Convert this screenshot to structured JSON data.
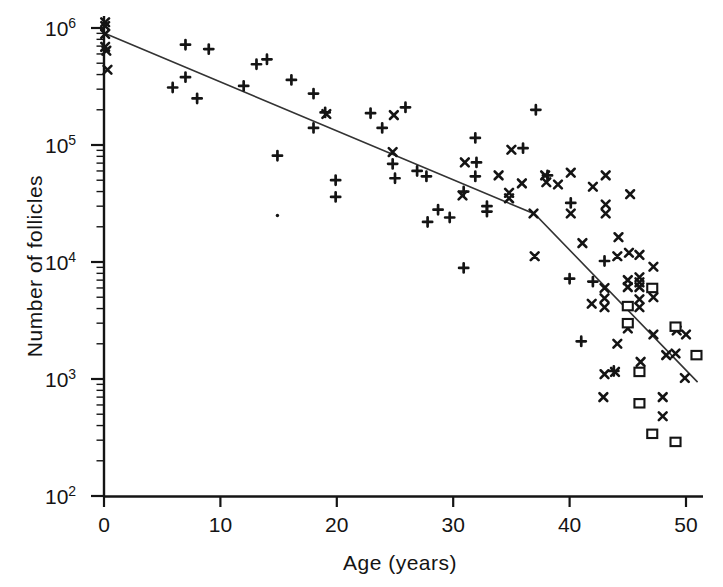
{
  "figure": {
    "width": 723,
    "height": 587,
    "background_color": "#ffffff",
    "ink_color": "#141414",
    "fit_line_color": "#333333"
  },
  "chart_data": {
    "type": "scatter",
    "title": "",
    "xlabel": "Age (years)",
    "ylabel": "Number of follicles",
    "x_ticks": [
      0,
      10,
      20,
      30,
      40,
      50
    ],
    "xlim": [
      0,
      51.5
    ],
    "y_scale": "log10",
    "y_tick_base": "10",
    "y_tick_exponents": [
      6,
      5,
      4,
      3,
      2
    ],
    "y_minor_tick_decades": [
      2,
      3,
      4,
      5
    ],
    "ylim": [
      100,
      1250000
    ],
    "grid": "off",
    "legend": "none",
    "fit_line": {
      "description": "biphasic decline fit with breakpoint near age 37",
      "points_age_count": [
        [
          0,
          905000
        ],
        [
          37,
          25700
        ],
        [
          51,
          940
        ]
      ]
    },
    "series": [
      {
        "name": "plus-markers",
        "marker": "plus",
        "points_age_count": [
          [
            7.0,
            720000
          ],
          [
            9.0,
            660000
          ],
          [
            5.9,
            310000
          ],
          [
            7.0,
            380000
          ],
          [
            8.0,
            250000
          ],
          [
            12.0,
            320000
          ],
          [
            13.1,
            490000
          ],
          [
            14.0,
            540000
          ],
          [
            16.1,
            360000
          ],
          [
            18.0,
            275000
          ],
          [
            18.0,
            140000
          ],
          [
            19.0,
            190000
          ],
          [
            14.9,
            81000
          ],
          [
            19.9,
            50000
          ],
          [
            19.9,
            36000
          ],
          [
            22.9,
            187000
          ],
          [
            25.9,
            210000
          ],
          [
            23.9,
            140000
          ],
          [
            24.8,
            69000
          ],
          [
            25.0,
            52000
          ],
          [
            26.9,
            60000
          ],
          [
            27.7,
            54000
          ],
          [
            31.9,
            115000
          ],
          [
            32.0,
            71000
          ],
          [
            31.9,
            54000
          ],
          [
            36.0,
            94000
          ],
          [
            37.1,
            200000
          ],
          [
            30.9,
            40000
          ],
          [
            28.7,
            28000
          ],
          [
            27.8,
            22000
          ],
          [
            29.7,
            24000
          ],
          [
            32.9,
            30000
          ],
          [
            32.9,
            27000
          ],
          [
            30.9,
            8900
          ],
          [
            38.1,
            55000
          ],
          [
            40.1,
            32000
          ],
          [
            43.0,
            10200
          ],
          [
            40.0,
            7200
          ],
          [
            42.0,
            6800
          ],
          [
            41.0,
            2100
          ],
          [
            43.8,
            1170
          ]
        ]
      },
      {
        "name": "cross-markers",
        "marker": "cross",
        "points_age_count": [
          [
            0.1,
            1120000
          ],
          [
            0.1,
            1040000
          ],
          [
            0.1,
            890000
          ],
          [
            0.1,
            690000
          ],
          [
            0.2,
            640000
          ],
          [
            0.3,
            440000
          ],
          [
            19.1,
            184000
          ],
          [
            24.9,
            180000
          ],
          [
            24.8,
            87000
          ],
          [
            31.0,
            71000
          ],
          [
            33.9,
            55000
          ],
          [
            35.0,
            91000
          ],
          [
            30.8,
            37000
          ],
          [
            34.8,
            39000
          ],
          [
            34.8,
            35000
          ],
          [
            35.9,
            47000
          ],
          [
            36.9,
            26000
          ],
          [
            37.9,
            55000
          ],
          [
            38.0,
            48000
          ],
          [
            39.0,
            46000
          ],
          [
            40.1,
            58000
          ],
          [
            42.0,
            44000
          ],
          [
            43.1,
            55000
          ],
          [
            45.2,
            38000
          ],
          [
            40.1,
            26000
          ],
          [
            43.1,
            31000
          ],
          [
            43.1,
            26000
          ],
          [
            41.1,
            14500
          ],
          [
            44.2,
            16300
          ],
          [
            37.0,
            11200
          ],
          [
            44.1,
            11200
          ],
          [
            45.1,
            12000
          ],
          [
            46.0,
            11500
          ],
          [
            47.2,
            9100
          ],
          [
            43.0,
            6000
          ],
          [
            45.0,
            7000
          ],
          [
            45.0,
            6100
          ],
          [
            46.0,
            7400
          ],
          [
            46.0,
            6700
          ],
          [
            46.0,
            6100
          ],
          [
            46.0,
            4800
          ],
          [
            47.2,
            5000
          ],
          [
            46.0,
            4100
          ],
          [
            43.0,
            4900
          ],
          [
            41.9,
            4400
          ],
          [
            43.0,
            4100
          ],
          [
            49.2,
            2600
          ],
          [
            50.0,
            2400
          ],
          [
            47.2,
            2400
          ],
          [
            45.0,
            2700
          ],
          [
            44.1,
            2000
          ],
          [
            48.3,
            1600
          ],
          [
            49.1,
            1650
          ],
          [
            46.1,
            1400
          ],
          [
            43.0,
            1100
          ],
          [
            43.9,
            1150
          ],
          [
            49.9,
            1020
          ],
          [
            42.9,
            700
          ],
          [
            48.0,
            700
          ],
          [
            48.0,
            480
          ]
        ]
      },
      {
        "name": "square-markers",
        "marker": "square",
        "points_age_count": [
          [
            47.1,
            6000
          ],
          [
            45.0,
            4200
          ],
          [
            45.0,
            3000
          ],
          [
            49.1,
            2800
          ],
          [
            50.9,
            1600
          ],
          [
            46.0,
            1150
          ],
          [
            46.0,
            620
          ],
          [
            47.1,
            340
          ],
          [
            49.1,
            290
          ]
        ]
      },
      {
        "name": "dot-markers",
        "marker": "dot",
        "points_age_count": [
          [
            14.9,
            25000
          ]
        ]
      }
    ]
  }
}
